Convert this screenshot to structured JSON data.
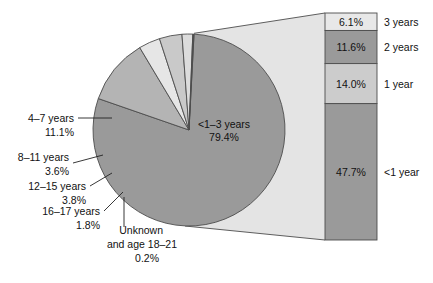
{
  "chart_data": {
    "type": "pie",
    "title": "",
    "subtitle": "",
    "xlabel": "",
    "ylabel": "",
    "legend_position": "none",
    "grid": false,
    "pie": {
      "center_label_line1": "<1–3 years",
      "center_label_line2": "79.4%",
      "categories": [
        "<1–3 years",
        "4–7 years",
        "8–11 years",
        "12–15 years",
        "16–17 years",
        "Unknown and age 18–21"
      ],
      "values": [
        79.4,
        11.1,
        3.6,
        3.8,
        1.8,
        0.2
      ],
      "value_labels": [
        "79.4%",
        "11.1%",
        "3.6%",
        "3.8%",
        "1.8%",
        "0.2%"
      ],
      "colors": [
        "#9a9a9a",
        "#b4b4b4",
        "#e6e6e6",
        "#c9c9c9",
        "#dcdcdc",
        "#4a4a4a"
      ]
    },
    "exploded_bar": {
      "source_category": "<1–3 years",
      "source_value": 79.4,
      "categories": [
        "3 years",
        "2 years",
        "1 year",
        "<1 year"
      ],
      "values": [
        6.1,
        11.6,
        14.0,
        47.7
      ],
      "value_labels": [
        "6.1%",
        "11.6%",
        "14.0%",
        "47.7%"
      ],
      "colors": [
        "#e8e8e8",
        "#9a9a9a",
        "#cccccc",
        "#9a9a9a"
      ]
    }
  },
  "pie_labels": [
    {
      "name": "slice-label-4-7-years",
      "line1": "4–7 years",
      "line2": "11.1%"
    },
    {
      "name": "slice-label-8-11-years",
      "line1": "8–11 years",
      "line2": "3.6%"
    },
    {
      "name": "slice-label-12-15-years",
      "line1": "12–15 years",
      "line2": "3.8%"
    },
    {
      "name": "slice-label-16-17-years",
      "line1": "16–17 years",
      "line2": "1.8%"
    },
    {
      "name": "slice-label-unknown",
      "line1": "Unknown",
      "line2": "and age 18–21",
      "line3": "0.2%"
    }
  ],
  "bar_segments": [
    {
      "name": "bar-segment-3-years",
      "value_label": "6.1%",
      "category": "3 years"
    },
    {
      "name": "bar-segment-2-years",
      "value_label": "11.6%",
      "category": "2 years"
    },
    {
      "name": "bar-segment-1-year",
      "value_label": "14.0%",
      "category": "1 year"
    },
    {
      "name": "bar-segment-under-1-year",
      "value_label": "47.7%",
      "category": "<1 year"
    }
  ],
  "center": {
    "line1": "<1–3 years",
    "line2": "79.4%"
  },
  "colors": {
    "slice_main": "#9a9a9a",
    "slice_4_7": "#b4b4b4",
    "slice_8_11": "#e6e6e6",
    "slice_12_15": "#c9c9c9",
    "slice_16_17": "#dcdcdc",
    "slice_unknown": "#4a4a4a",
    "connector_fill": "#e4e4e4",
    "bar_3y": "#e8e8e8",
    "bar_2y": "#9a9a9a",
    "bar_1y": "#cccccc",
    "bar_lt1y": "#9a9a9a",
    "outline": "#4d4d4d",
    "text": "#111111"
  }
}
